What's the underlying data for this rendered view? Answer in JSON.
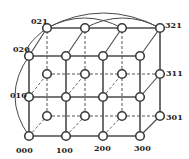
{
  "diagram": {
    "title": "",
    "colors": {
      "edge": "#4a4a4a",
      "node_fill": "#ffffff",
      "node_stroke": "#3a3a3a",
      "label": "#222222"
    },
    "dims": {
      "x": 4,
      "y": 3,
      "z": 2
    },
    "front_x": [
      29,
      66,
      103,
      140
    ],
    "back_x": [
      47,
      85,
      122,
      160
    ],
    "front_y": [
      136,
      97,
      56
    ],
    "back_y": [
      116,
      74,
      28
    ],
    "labels": [
      {
        "id": "000",
        "text": "000",
        "x": 16,
        "y": 153
      },
      {
        "id": "100",
        "text": "100",
        "x": 56,
        "y": 153
      },
      {
        "id": "200",
        "text": "200",
        "x": 94,
        "y": 151
      },
      {
        "id": "300",
        "text": "300",
        "x": 134,
        "y": 151
      },
      {
        "id": "010",
        "text": "010",
        "x": 10,
        "y": 98
      },
      {
        "id": "020",
        "text": "020",
        "x": 13,
        "y": 52
      },
      {
        "id": "021",
        "text": "021",
        "x": 31,
        "y": 24
      },
      {
        "id": "321",
        "text": "321",
        "x": 165,
        "y": 28
      },
      {
        "id": "311",
        "text": "311",
        "x": 166,
        "y": 76
      },
      {
        "id": "301",
        "text": "301",
        "x": 166,
        "y": 120
      }
    ]
  }
}
